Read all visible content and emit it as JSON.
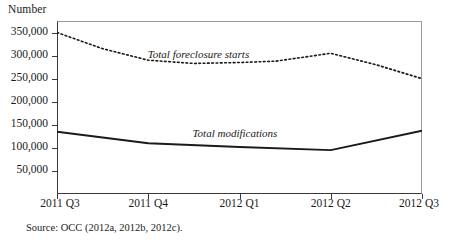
{
  "figure": {
    "ylabel": "Number",
    "source_note": "Source: OCC (2012a, 2012b, 2012c)."
  },
  "chart_data": {
    "type": "line",
    "title": "",
    "xlabel": "",
    "ylabel": "Number",
    "categories": [
      "2011 Q3",
      "2011 Q4",
      "2012 Q1",
      "2012 Q2",
      "2012 Q3"
    ],
    "x": [
      0,
      1,
      2,
      3,
      4
    ],
    "ylim": [
      0,
      375000
    ],
    "yticks": [
      50000,
      100000,
      150000,
      200000,
      250000,
      300000,
      350000
    ],
    "ytick_labels": [
      "50,000",
      "100,000",
      "150,000",
      "200,000",
      "250,000",
      "300,000",
      "350,000"
    ],
    "grid": false,
    "legend_position": "inline-annotations",
    "series": [
      {
        "name": "Total foreclosure starts",
        "style": "dotted",
        "color": "#1a1a1a",
        "values": [
          350000,
          290000,
          285000,
          305000,
          250000
        ],
        "detail_x": [
          0,
          0.5,
          1,
          1.5,
          2,
          2.4,
          3,
          3.5,
          4
        ],
        "detail_values": [
          350000,
          315000,
          290000,
          283000,
          285000,
          288000,
          305000,
          280000,
          250000
        ],
        "label_text": "Total foreclosure starts"
      },
      {
        "name": "Total modifications",
        "style": "solid",
        "color": "#1a1a1a",
        "values": [
          135000,
          110000,
          102000,
          95000,
          137000
        ],
        "detail_x": [
          0,
          1,
          2,
          3,
          4
        ],
        "detail_values": [
          135000,
          110000,
          102000,
          95000,
          137000
        ],
        "label_text": "Total modifications"
      }
    ],
    "annotations": [
      {
        "text": "Total foreclosure starts",
        "x": 1.55,
        "y": 300000
      },
      {
        "text": "Total modifications",
        "x": 1.95,
        "y": 128000
      }
    ]
  }
}
